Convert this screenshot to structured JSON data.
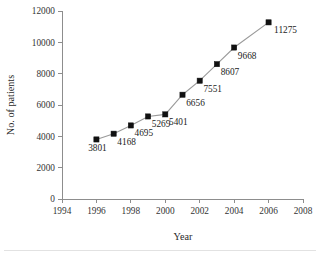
{
  "chart_data": {
    "type": "line",
    "title": "",
    "xlabel": "Year",
    "ylabel": "No. of patients",
    "x": [
      1996,
      1997,
      1998,
      1999,
      2000,
      2001,
      2002,
      2003,
      2004,
      2006
    ],
    "values": [
      3801,
      4168,
      4695,
      5269,
      5401,
      6656,
      7551,
      8607,
      9668,
      11275
    ],
    "point_labels": [
      "3801",
      "4168",
      "4695",
      "5269",
      "5401",
      "6656",
      "7551",
      "8607",
      "9668",
      "11275"
    ],
    "xlim": [
      1994,
      2008
    ],
    "ylim": [
      0,
      12000
    ],
    "xticks": [
      1994,
      1996,
      1998,
      2000,
      2002,
      2004,
      2006,
      2008
    ],
    "xtick_labels": [
      "1994",
      "1996",
      "1998",
      "2000",
      "2002",
      "2004",
      "2006",
      "2008"
    ],
    "yticks": [
      0,
      2000,
      4000,
      6000,
      8000,
      10000,
      12000
    ],
    "ytick_labels": [
      "0",
      "2000",
      "4000",
      "6000",
      "8000",
      "10000",
      "12000"
    ],
    "grid": false,
    "legend": false,
    "marker": "filled-square",
    "marker_color": "#111111",
    "line_color": "#9a9a9a",
    "axis_color": "#8d8d8d",
    "background": "#ffffff"
  }
}
